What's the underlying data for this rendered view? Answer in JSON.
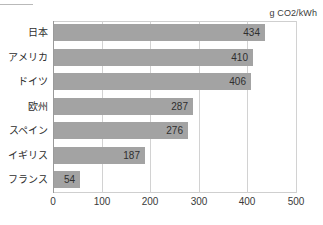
{
  "chart_data": {
    "type": "bar",
    "orientation": "horizontal",
    "title": "",
    "unit_label": "g CO2/kWh",
    "xlabel": "",
    "ylabel": "",
    "categories": [
      "日本",
      "アメリカ",
      "ドイツ",
      "欧州",
      "スペイン",
      "イギリス",
      "フランス"
    ],
    "values": [
      434,
      410,
      406,
      287,
      276,
      187,
      54
    ],
    "value_labels": [
      "434",
      "410",
      "406",
      "287",
      "276",
      "187",
      "54"
    ],
    "xlim": [
      0,
      500
    ],
    "xticks": [
      0,
      100,
      200,
      300,
      400,
      500
    ],
    "xtick_labels": [
      "0",
      "100",
      "200",
      "300",
      "400",
      "500"
    ],
    "grid": true,
    "legend": null,
    "series": [
      {
        "name": "",
        "values": [
          434,
          410,
          406,
          287,
          276,
          187,
          54
        ]
      }
    ]
  },
  "colors": {
    "bar": "#a3a3a3",
    "grid": "#d2d2d2",
    "axis": "#9a9a9a",
    "text": "#2e2e2e",
    "background": "#ffffff"
  }
}
